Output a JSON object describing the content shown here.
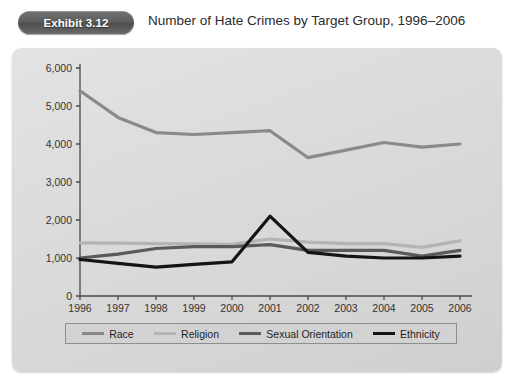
{
  "header": {
    "badge_label": "Exhibit 3.12",
    "title": "Number of Hate Crimes by Target Group, 1996–2006"
  },
  "colors": {
    "race": "#8a8a8a",
    "religion": "#b4b4b4",
    "sexual_orientation": "#5a5a5a",
    "ethnicity": "#141414",
    "axis": "#4a4a4a",
    "panel_bg": "#dcdcdc",
    "legend_bg": "#d2d2d2",
    "badge_bg": "#5e5e5e"
  },
  "chart_data": {
    "type": "line",
    "title": "Number of Hate Crimes by Target Group, 1996–2006",
    "xlabel": "",
    "ylabel": "",
    "grid": false,
    "legend_position": "bottom",
    "ylim": [
      0,
      6000
    ],
    "yticks": [
      0,
      1000,
      2000,
      3000,
      4000,
      5000,
      6000
    ],
    "ytick_labels": [
      "0",
      "1,000",
      "2,000",
      "3,000",
      "4,000",
      "5,000",
      "6,000"
    ],
    "categories": [
      "1996",
      "1997",
      "1998",
      "1999",
      "2000",
      "2001",
      "2002",
      "2003",
      "2004",
      "2005",
      "2006"
    ],
    "x": [
      1996,
      1997,
      1998,
      1999,
      2000,
      2001,
      2002,
      2003,
      2004,
      2005,
      2006
    ],
    "series": [
      {
        "name": "Race",
        "color": "#8a8a8a",
        "width": 3.2,
        "values": [
          5400,
          4700,
          4300,
          4250,
          4300,
          4350,
          3640,
          3840,
          4040,
          3920,
          4000
        ]
      },
      {
        "name": "Religion",
        "color": "#b4b4b4",
        "width": 3.2,
        "values": [
          1400,
          1390,
          1380,
          1370,
          1360,
          1500,
          1420,
          1380,
          1380,
          1280,
          1450
        ]
      },
      {
        "name": "Sexual Orientation",
        "color": "#5a5a5a",
        "width": 3.2,
        "values": [
          1000,
          1100,
          1250,
          1300,
          1300,
          1350,
          1200,
          1200,
          1200,
          1050,
          1200
        ]
      },
      {
        "name": "Ethnicity",
        "color": "#141414",
        "width": 3.2,
        "values": [
          960,
          860,
          760,
          830,
          900,
          2100,
          1150,
          1050,
          1000,
          1000,
          1050
        ]
      }
    ]
  },
  "legend": {
    "items": [
      {
        "label": "Race",
        "color": "#8a8a8a"
      },
      {
        "label": "Religion",
        "color": "#b4b4b4"
      },
      {
        "label": "Sexual Orientation",
        "color": "#5a5a5a"
      },
      {
        "label": "Ethnicity",
        "color": "#141414"
      }
    ]
  }
}
